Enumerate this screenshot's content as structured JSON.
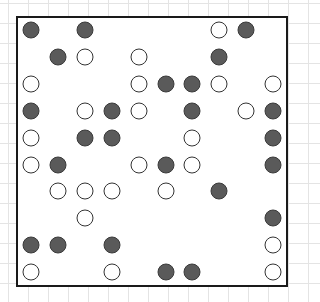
{
  "board": {
    "rows": 10,
    "cols": 10,
    "colors": {
      "filled": "#5a5a5a",
      "open": "#ffffff",
      "outline": "#333333",
      "border": "#1a1a1a"
    },
    "pieces": [
      {
        "r": 0,
        "c": 0,
        "t": "filled"
      },
      {
        "r": 0,
        "c": 2,
        "t": "filled"
      },
      {
        "r": 0,
        "c": 7,
        "t": "open"
      },
      {
        "r": 0,
        "c": 8,
        "t": "filled"
      },
      {
        "r": 1,
        "c": 1,
        "t": "filled"
      },
      {
        "r": 1,
        "c": 2,
        "t": "open"
      },
      {
        "r": 1,
        "c": 4,
        "t": "open"
      },
      {
        "r": 1,
        "c": 7,
        "t": "filled"
      },
      {
        "r": 2,
        "c": 0,
        "t": "open"
      },
      {
        "r": 2,
        "c": 4,
        "t": "open"
      },
      {
        "r": 2,
        "c": 5,
        "t": "filled"
      },
      {
        "r": 2,
        "c": 6,
        "t": "filled"
      },
      {
        "r": 2,
        "c": 7,
        "t": "open"
      },
      {
        "r": 2,
        "c": 9,
        "t": "open"
      },
      {
        "r": 3,
        "c": 0,
        "t": "filled"
      },
      {
        "r": 3,
        "c": 2,
        "t": "open"
      },
      {
        "r": 3,
        "c": 3,
        "t": "filled"
      },
      {
        "r": 3,
        "c": 4,
        "t": "open"
      },
      {
        "r": 3,
        "c": 6,
        "t": "filled"
      },
      {
        "r": 3,
        "c": 8,
        "t": "open"
      },
      {
        "r": 3,
        "c": 9,
        "t": "filled"
      },
      {
        "r": 4,
        "c": 0,
        "t": "open"
      },
      {
        "r": 4,
        "c": 2,
        "t": "filled"
      },
      {
        "r": 4,
        "c": 3,
        "t": "filled"
      },
      {
        "r": 4,
        "c": 6,
        "t": "open"
      },
      {
        "r": 4,
        "c": 9,
        "t": "filled"
      },
      {
        "r": 5,
        "c": 0,
        "t": "open"
      },
      {
        "r": 5,
        "c": 1,
        "t": "filled"
      },
      {
        "r": 5,
        "c": 4,
        "t": "open"
      },
      {
        "r": 5,
        "c": 5,
        "t": "filled"
      },
      {
        "r": 5,
        "c": 6,
        "t": "open"
      },
      {
        "r": 5,
        "c": 9,
        "t": "filled"
      },
      {
        "r": 6,
        "c": 1,
        "t": "open"
      },
      {
        "r": 6,
        "c": 2,
        "t": "open"
      },
      {
        "r": 6,
        "c": 3,
        "t": "open"
      },
      {
        "r": 6,
        "c": 5,
        "t": "open"
      },
      {
        "r": 6,
        "c": 7,
        "t": "filled"
      },
      {
        "r": 7,
        "c": 2,
        "t": "open"
      },
      {
        "r": 7,
        "c": 9,
        "t": "filled"
      },
      {
        "r": 8,
        "c": 0,
        "t": "filled"
      },
      {
        "r": 8,
        "c": 1,
        "t": "filled"
      },
      {
        "r": 8,
        "c": 3,
        "t": "filled"
      },
      {
        "r": 8,
        "c": 9,
        "t": "open"
      },
      {
        "r": 9,
        "c": 0,
        "t": "open"
      },
      {
        "r": 9,
        "c": 3,
        "t": "open"
      },
      {
        "r": 9,
        "c": 5,
        "t": "filled"
      },
      {
        "r": 9,
        "c": 6,
        "t": "filled"
      },
      {
        "r": 9,
        "c": 9,
        "t": "open"
      }
    ]
  }
}
